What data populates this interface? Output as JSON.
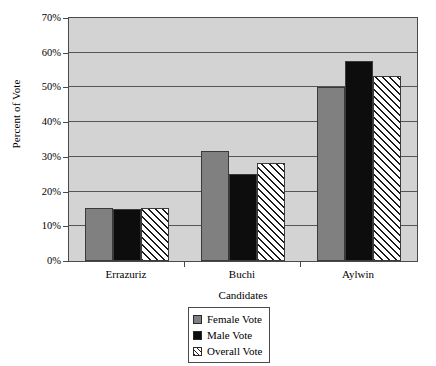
{
  "chart_data": {
    "type": "bar",
    "title": "",
    "xlabel": "Candidates",
    "ylabel": "Percent of Vote",
    "categories": [
      "Errazuriz",
      "Buchi",
      "Aylwin"
    ],
    "series": [
      {
        "name": "Female Vote",
        "values": [
          15.4,
          31.8,
          50.2
        ],
        "color": "#808080",
        "pattern": "solid"
      },
      {
        "name": "Male Vote",
        "values": [
          15.0,
          25.1,
          57.5
        ],
        "color": "#0d0d0d",
        "pattern": "solid"
      },
      {
        "name": "Overall Vote",
        "values": [
          15.2,
          28.2,
          53.4
        ],
        "color": "#ffffff",
        "pattern": "diagonal-hatch"
      }
    ],
    "ylim": [
      0,
      70
    ],
    "ytick_values": [
      0,
      10,
      20,
      30,
      40,
      50,
      60,
      70
    ],
    "ytick_labels": [
      "0%",
      "10%",
      "20%",
      "30%",
      "40%",
      "50%",
      "60%",
      "70%"
    ],
    "grid": true,
    "legend_position": "bottom-center",
    "plot_background": "#d3d3d3",
    "axis_color": "#4a4a4a"
  },
  "legend": {
    "items": [
      {
        "label": "Female Vote"
      },
      {
        "label": "Male Vote"
      },
      {
        "label": "Overall Vote"
      }
    ]
  }
}
